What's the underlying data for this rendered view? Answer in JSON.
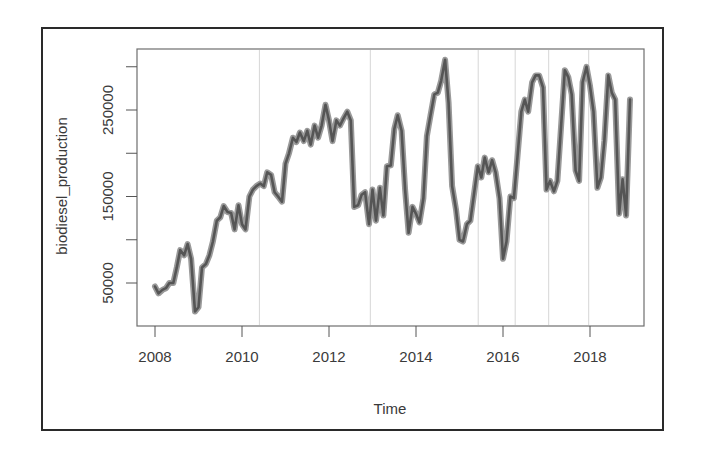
{
  "chart_data": {
    "type": "line",
    "title": "",
    "xlabel": "Time",
    "ylabel": "biodiesel_production",
    "x_ticks": [
      "2008",
      "2010",
      "2012",
      "2014",
      "2016",
      "2018"
    ],
    "y_tick_labels": [
      "50000",
      "150000",
      "250000"
    ],
    "y_ticks": [
      50000,
      100000,
      150000,
      200000,
      250000,
      300000
    ],
    "xlim": [
      2007.6,
      2019.3
    ],
    "ylim": [
      15000,
      335000
    ],
    "grid": "vertical grey reference lines at irregular positions",
    "vlines": [
      2010.4,
      2012.95,
      2015.43,
      2016.28,
      2017.05,
      2017.97
    ],
    "series": [
      {
        "name": "biodiesel_production",
        "x": [
          2008.0,
          2008.08,
          2008.17,
          2008.25,
          2008.33,
          2008.42,
          2008.5,
          2008.58,
          2008.67,
          2008.75,
          2008.83,
          2008.92,
          2009.0,
          2009.08,
          2009.17,
          2009.25,
          2009.33,
          2009.42,
          2009.5,
          2009.58,
          2009.67,
          2009.75,
          2009.83,
          2009.92,
          2010.0,
          2010.08,
          2010.17,
          2010.25,
          2010.33,
          2010.42,
          2010.5,
          2010.58,
          2010.67,
          2010.75,
          2010.83,
          2010.92,
          2011.0,
          2011.08,
          2011.17,
          2011.25,
          2011.33,
          2011.42,
          2011.5,
          2011.58,
          2011.67,
          2011.75,
          2011.83,
          2011.92,
          2012.0,
          2012.08,
          2012.17,
          2012.25,
          2012.33,
          2012.42,
          2012.5,
          2012.58,
          2012.67,
          2012.75,
          2012.83,
          2012.92,
          2013.0,
          2013.08,
          2013.17,
          2013.25,
          2013.33,
          2013.42,
          2013.5,
          2013.58,
          2013.67,
          2013.75,
          2013.83,
          2013.92,
          2014.0,
          2014.08,
          2014.17,
          2014.25,
          2014.33,
          2014.42,
          2014.5,
          2014.58,
          2014.67,
          2014.75,
          2014.83,
          2014.92,
          2015.0,
          2015.08,
          2015.17,
          2015.25,
          2015.33,
          2015.42,
          2015.5,
          2015.58,
          2015.67,
          2015.75,
          2015.83,
          2015.92,
          2016.0,
          2016.08,
          2016.17,
          2016.25,
          2016.33,
          2016.42,
          2016.5,
          2016.58,
          2016.67,
          2016.75,
          2016.83,
          2016.92,
          2017.0,
          2017.08,
          2017.17,
          2017.25,
          2017.33,
          2017.42,
          2017.5,
          2017.58,
          2017.67,
          2017.75,
          2017.83,
          2017.92,
          2018.0,
          2018.08,
          2018.17,
          2018.25,
          2018.33,
          2018.42,
          2018.5,
          2018.58,
          2018.67,
          2018.75,
          2018.83,
          2018.92
        ],
        "values": [
          46000,
          38000,
          42000,
          44000,
          50000,
          50000,
          68000,
          88000,
          82000,
          95000,
          78000,
          17000,
          22000,
          68000,
          72000,
          82000,
          98000,
          122000,
          126000,
          139000,
          132000,
          131000,
          112000,
          140000,
          118000,
          112000,
          150000,
          158000,
          162000,
          165000,
          162000,
          178000,
          175000,
          155000,
          150000,
          144000,
          188000,
          200000,
          218000,
          213000,
          224000,
          214000,
          226000,
          210000,
          232000,
          218000,
          232000,
          256000,
          238000,
          214000,
          238000,
          232000,
          240000,
          248000,
          238000,
          138000,
          140000,
          152000,
          155000,
          118000,
          158000,
          122000,
          160000,
          128000,
          185000,
          186000,
          228000,
          244000,
          226000,
          158000,
          108000,
          138000,
          130000,
          120000,
          148000,
          220000,
          243000,
          268000,
          270000,
          284000,
          308000,
          258000,
          162000,
          135000,
          100000,
          98000,
          118000,
          122000,
          152000,
          185000,
          172000,
          195000,
          178000,
          192000,
          178000,
          148000,
          78000,
          98000,
          150000,
          148000,
          195000,
          248000,
          262000,
          248000,
          282000,
          290000,
          290000,
          276000,
          158000,
          168000,
          156000,
          168000,
          228000,
          296000,
          288000,
          268000,
          180000,
          168000,
          282000,
          300000,
          278000,
          248000,
          160000,
          172000,
          215000,
          290000,
          270000,
          262000,
          130000,
          170000,
          128000,
          262000
        ]
      }
    ]
  }
}
